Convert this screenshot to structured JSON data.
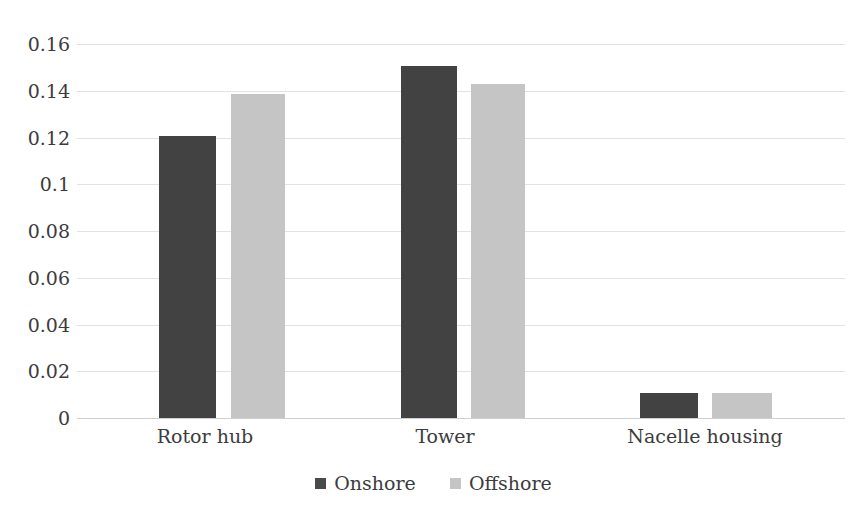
{
  "chart_data": {
    "type": "bar",
    "title": "",
    "subtitle": "",
    "xlabel": "",
    "ylabel": "",
    "categories": [
      "Rotor hub",
      "Tower",
      "Nacelle housing"
    ],
    "series": [
      {
        "name": "Onshore",
        "color": "#424242",
        "values": [
          0.1205,
          0.1505,
          0.0105
        ]
      },
      {
        "name": "Offshore",
        "color": "#c5c5c5",
        "values": [
          0.1385,
          0.143,
          0.0105
        ]
      }
    ],
    "ylim": [
      0,
      0.16
    ],
    "yticks": [
      0,
      0.02,
      0.04,
      0.06,
      0.08,
      0.1,
      0.12,
      0.14,
      0.16
    ],
    "ytick_labels": [
      "0",
      "0.02",
      "0.04",
      "0.06",
      "0.08",
      "0.1",
      "0.12",
      "0.14",
      "0.16"
    ],
    "grid": true,
    "grid_axis": "y",
    "legend": {
      "position": "bottom",
      "entries": [
        {
          "label": "Onshore",
          "swatch": "legend-swatch-onshore"
        },
        {
          "label": "Offshore",
          "swatch": "legend-swatch-offshore"
        }
      ]
    },
    "colors": {
      "onshore": "#424242",
      "offshore": "#c5c5c5",
      "gridline": "#e3e3e3",
      "axis": "#cfcfcf",
      "text": "#3c3c3c",
      "background": "#ffffff"
    }
  }
}
